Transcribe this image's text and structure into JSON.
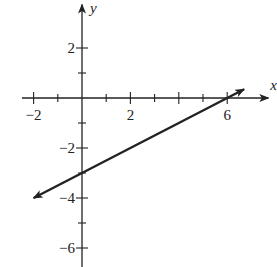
{
  "chart_data": {
    "type": "line",
    "title": "",
    "xlabel": "x",
    "ylabel": "y",
    "xlim": [
      -2.4,
      7.7
    ],
    "ylim": [
      -7.0,
      3.9
    ],
    "x_ticks": [
      -2,
      -1,
      0,
      1,
      2,
      3,
      4,
      5,
      6
    ],
    "x_tick_labels": [
      {
        "value": -2,
        "label": "−2"
      },
      {
        "value": 2,
        "label": "2"
      },
      {
        "value": 6,
        "label": "6"
      }
    ],
    "y_ticks": [
      2,
      1,
      -1,
      -2,
      -3,
      -4,
      -5,
      -6
    ],
    "y_tick_labels": [
      {
        "value": 2,
        "label": "2"
      },
      {
        "value": -2,
        "label": "−2"
      },
      {
        "value": -4,
        "label": "−4"
      },
      {
        "value": -6,
        "label": "−6"
      }
    ],
    "grid": false,
    "legend": null,
    "series": [
      {
        "name": "line",
        "equation": "y = 0.5x - 3",
        "slope": 0.5,
        "y_intercept": -3,
        "x_intercept": 6,
        "x": [
          -2,
          0,
          6,
          6.7
        ],
        "y": [
          -4,
          -3,
          0,
          0.35
        ],
        "arrows": "both"
      }
    ],
    "color": "#222222"
  }
}
